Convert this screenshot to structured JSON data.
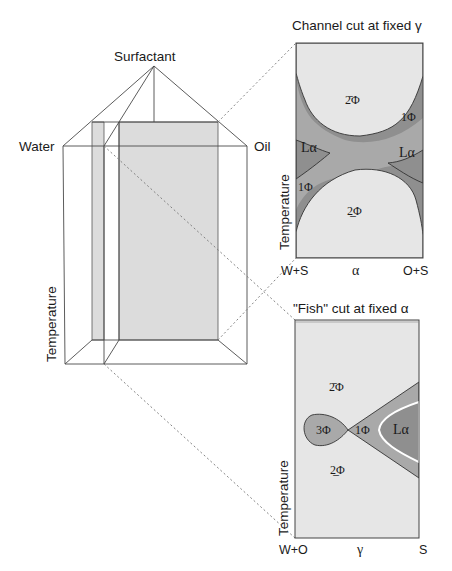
{
  "prism": {
    "vertex_top": "Surfactant",
    "vertex_left": "Water",
    "vertex_right": "Oil",
    "axis_label": "Temperature"
  },
  "channel_cut": {
    "title": "Channel cut at fixed γ",
    "y_label": "Temperature",
    "x_left": "W+S",
    "x_mid": "α",
    "x_right": "O+S",
    "regions": {
      "upper": "2̄Φ",
      "lower": "2̲Φ",
      "la_left": "Lα",
      "la_right": "Lα",
      "one_phi_left": "1Φ",
      "one_phi_right": "1Φ"
    }
  },
  "fish_cut": {
    "title": "\"Fish\" cut at fixed α",
    "y_label": "Temperature",
    "x_left": "W+O",
    "x_mid": "γ",
    "x_right": "S",
    "regions": {
      "upper": "2̄Φ",
      "lower": "2̲Φ",
      "three_phi": "3Φ",
      "one_phi": "1Φ",
      "la": "Lα"
    }
  },
  "colors": {
    "light_region": "#e6e6e6",
    "dark_region": "#8f8f8f",
    "mid_region": "#a9a9a9",
    "plane_fill": "#dcdcdc",
    "line": "#4a4a4a"
  }
}
